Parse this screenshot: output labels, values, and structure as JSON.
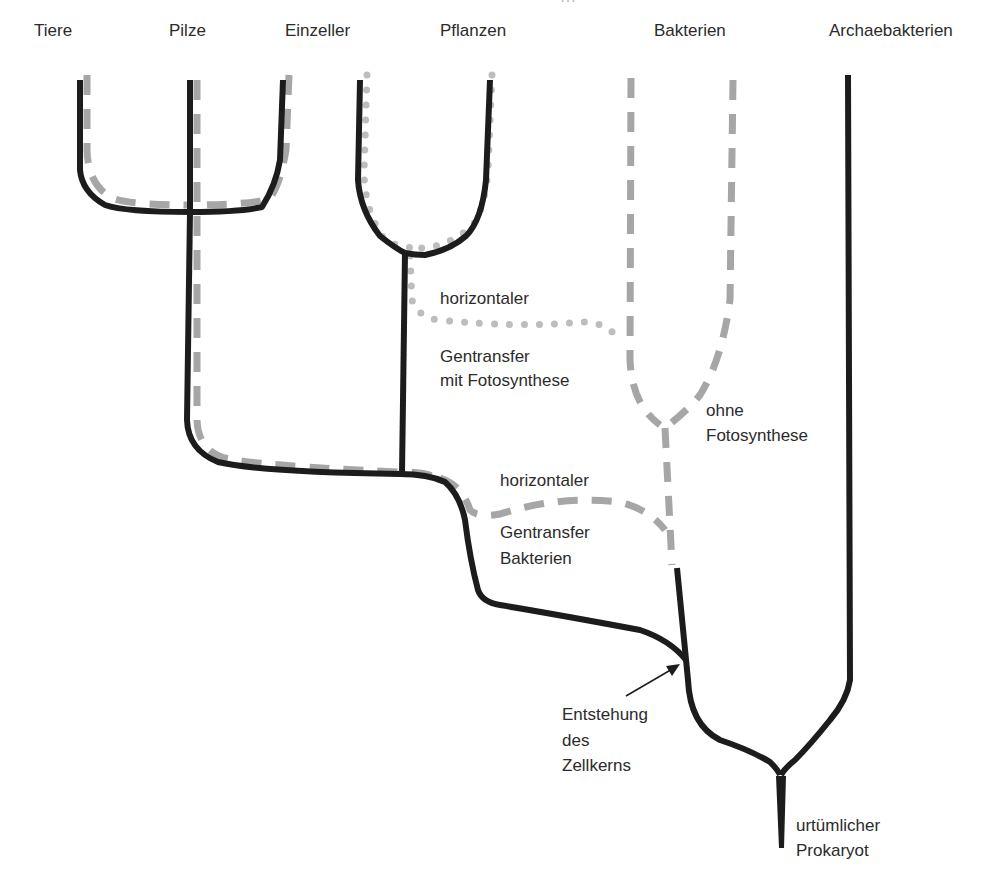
{
  "header": {
    "cutoff_text": "…"
  },
  "taxa": {
    "tiere": "Tiere",
    "pilze": "Pilze",
    "einzeller": "Einzeller",
    "pflanzen": "Pflanzen",
    "bakterien": "Bakterien",
    "archaebakterien": "Archaebakterien"
  },
  "annotations": {
    "hgt_photo_line1": "horizontaler",
    "hgt_photo_line2": "Gentransfer",
    "hgt_photo_line3": "mit Fotosynthese",
    "ohne_line1": "ohne",
    "ohne_line2": "Fotosynthese",
    "hgt_bact_line1": "horizontaler",
    "hgt_bact_line2": "Gentransfer",
    "hgt_bact_line3": "Bakterien",
    "nucleus_line1": "Entstehung",
    "nucleus_line2": "des",
    "nucleus_line3": "Zellkerns",
    "root_line1": "urtümlicher",
    "root_line2": "Prokaryot"
  },
  "legend_styles": {
    "lineage_solid": "#1c1c1c",
    "bacterial_dashed": "#a6a6a6",
    "photosynthetic_dotted": "#bdbdbd"
  }
}
